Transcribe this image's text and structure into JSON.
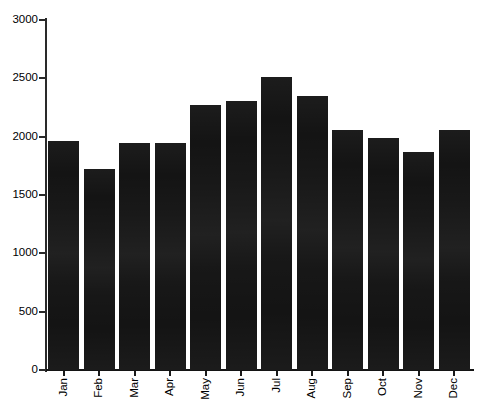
{
  "chart_data": {
    "type": "bar",
    "title": "",
    "subtitle": "",
    "xlabel": "",
    "ylabel": "",
    "categories": [
      "Jan",
      "Feb",
      "Mar",
      "Apr",
      "May",
      "Jun",
      "Jul",
      "Aug",
      "Sep",
      "Oct",
      "Nov",
      "Dec"
    ],
    "values": [
      1960,
      1720,
      1950,
      1945,
      2275,
      2310,
      2510,
      2345,
      2055,
      1985,
      1870,
      2055
    ],
    "ylim": [
      0,
      3000
    ],
    "y_ticks": [
      0,
      500,
      1000,
      1500,
      2000,
      2500,
      3000
    ],
    "y_tick_labels": [
      "0",
      "500",
      "1000",
      "1500",
      "2000",
      "2500",
      "3000"
    ],
    "grid": false,
    "legend": null,
    "legend_position": "none",
    "bar_color": "#141414",
    "axis_color": "#2a2a2a",
    "background_color": "#ffffff",
    "xtick_rotation": 90,
    "annotations": []
  }
}
